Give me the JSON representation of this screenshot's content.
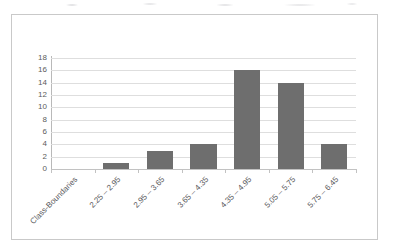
{
  "chart_data": {
    "type": "bar",
    "title": "",
    "subtitle": "",
    "xlabel": "",
    "ylabel": "",
    "categories": [
      "Class-Boundaries",
      "2.25 – 2.95",
      "2.95 – 3.65",
      "3.65 – 4.35",
      "4.35 – 4.95",
      "5.05 – 5.75",
      "5.75 – 6.45"
    ],
    "values": [
      0,
      1,
      3,
      4,
      16,
      14,
      4
    ],
    "ylim": [
      0,
      18
    ],
    "ytick_labels": [
      "18",
      "16",
      "14",
      "12",
      "10",
      "8",
      "6",
      "4",
      "2",
      "0"
    ],
    "ytick_values": [
      18,
      16,
      14,
      12,
      10,
      8,
      6,
      4,
      2,
      0
    ],
    "grid": true,
    "legend": false,
    "legend_position": "none",
    "bar_color": "#6e6e6e",
    "gridline_color": "#dedede",
    "axis_color": "#b9b9b9",
    "plot_background": "#ffffff",
    "frame_color": "#c9c9c9",
    "annotations": []
  }
}
